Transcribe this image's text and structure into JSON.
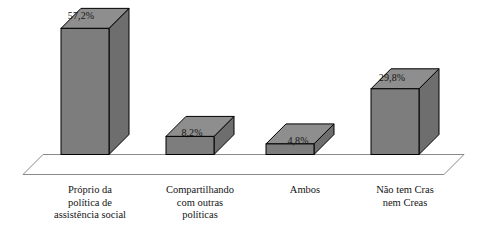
{
  "chart_data": {
    "type": "bar",
    "title": "",
    "subtitle": "",
    "xlabel": "",
    "ylabel": "",
    "grid": false,
    "legend": false,
    "legend_position": "none",
    "style": "3d-column",
    "axis_range": [
      0,
      60
    ],
    "categories": [
      "Próprio da política de assistência social",
      "Compartilhando com outras políticas",
      "Ambos",
      "Não tem Cras nem Creas"
    ],
    "category_lines": [
      [
        "Próprio da",
        "política de",
        "assistência social"
      ],
      [
        "Compartilhando",
        "com outras",
        "políticas"
      ],
      [
        "Ambos"
      ],
      [
        "Não tem Cras",
        "nem Creas"
      ]
    ],
    "values": [
      57.2,
      8.2,
      4.8,
      29.8
    ],
    "value_labels": [
      "57,2%",
      "8,2%",
      "4,8%",
      "29,8%"
    ],
    "colors": {
      "bar_front": "#7d7d7d",
      "bar_top": "#8e8e8e",
      "bar_side": "#6e6e6e",
      "outline": "#000000",
      "floor_line": "#808080",
      "background": "#ffffff",
      "text": "#141414"
    }
  }
}
